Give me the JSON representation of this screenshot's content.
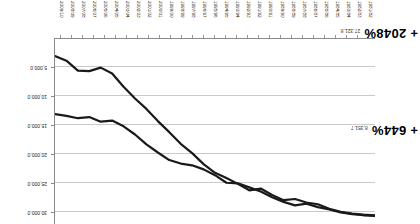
{
  "chart_data": {
    "type": "line",
    "title": "",
    "subtitle": "",
    "xlabel": "",
    "ylabel": "",
    "grid": true,
    "legend_position": "none",
    "orientation_note": "rendered rotated 180 degrees",
    "categories": [
      "1981/82",
      "1982/83",
      "1983/84",
      "1984/85",
      "1985/86",
      "1986/87",
      "1987/88",
      "1988/89",
      "1989/90",
      "1990/91",
      "1991/92",
      "1992/93",
      "1993/94",
      "1994/95",
      "1995/96",
      "1996/97",
      "1997/98",
      "1998/99",
      "1999/00",
      "2000/01",
      "2001/02",
      "2002/03",
      "2003/04",
      "2004/05",
      "2005/06",
      "2006/07",
      "2007/08",
      "2008/09",
      "2009/10"
    ],
    "ylim": [
      0,
      32000
    ],
    "yticks": [
      5000,
      10000,
      15000,
      20000,
      25000,
      30000
    ],
    "ytick_labels": [
      "5,000.0",
      "10,000.0",
      "15,000.0",
      "20,000.0",
      "25,000.0",
      "30,000.0"
    ],
    "series": [
      {
        "name": "series-a",
        "end_value": 8351.7,
        "end_label": "8,351.7",
        "growth_label": "+ 644%",
        "values": [
          30600,
          30500,
          30300,
          30000,
          29500,
          29100,
          28500,
          28800,
          28200,
          27400,
          26400,
          25700,
          25000,
          24900,
          23600,
          22600,
          21900,
          21600,
          21000,
          19700,
          18300,
          16600,
          15200,
          14200,
          14400,
          13600,
          13800,
          13400,
          13100
        ]
      },
      {
        "name": "series-b",
        "end_value": 27321.8,
        "end_label": "27,321.8",
        "growth_label": "+ 2048%",
        "values": [
          30500,
          30400,
          30200,
          29900,
          29400,
          28600,
          28300,
          27700,
          27900,
          27000,
          25900,
          26200,
          25100,
          24100,
          23200,
          21700,
          19800,
          18200,
          16200,
          14300,
          12200,
          10400,
          8400,
          6100,
          5100,
          5700,
          5600,
          3900,
          3100
        ]
      }
    ],
    "annotations": [
      {
        "id": "annot-top",
        "value_label": "8,351.7",
        "pct_label": "+ 644%"
      },
      {
        "id": "annot-bottom",
        "value_label": "27,321.8",
        "pct_label": "+ 2048%"
      }
    ]
  }
}
